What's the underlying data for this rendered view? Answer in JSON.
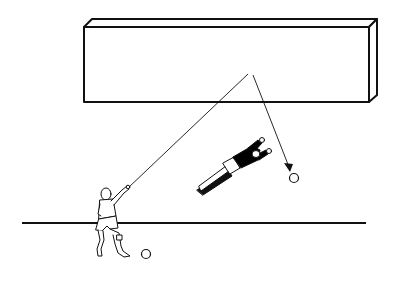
{
  "figure": {
    "description": "Line drawing: a player throws the ball toward a wall; the ball rebounds past a diving goalkeeper",
    "colors": {
      "ink": "#111111",
      "background": "#ffffff",
      "keeper_kit": "#000000"
    },
    "elements": {
      "wall": "rebound-wall",
      "ground": "ground-line",
      "thrower": "player-throwing",
      "keeper": "goalkeeper-diving",
      "ball_start": "ball",
      "ball_end": "ball-rebound",
      "path_in": "throw-path",
      "path_out": "rebound-path-arrow"
    }
  }
}
